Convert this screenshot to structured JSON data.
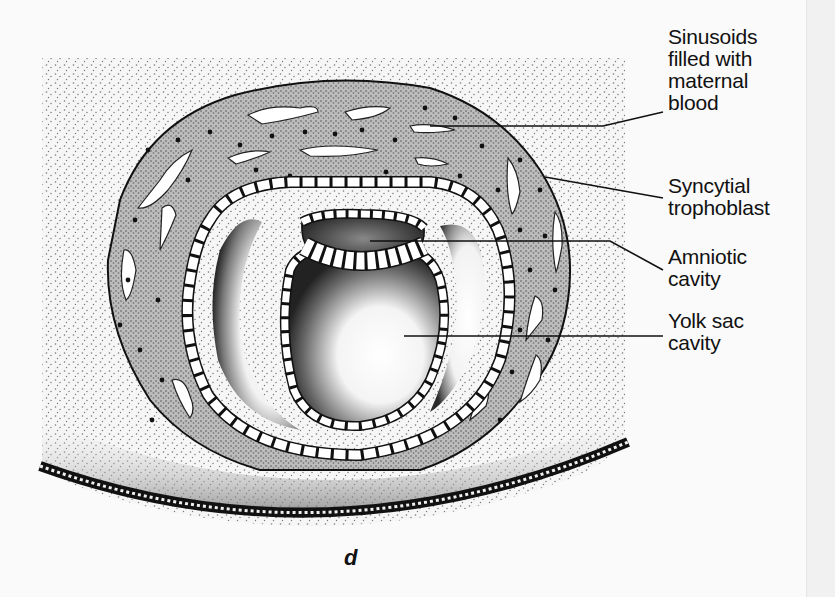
{
  "figure": {
    "caption": "d",
    "labels": [
      {
        "id": "sinusoids",
        "lines": [
          "Sinusoids",
          "filled with",
          "maternal",
          "blood"
        ]
      },
      {
        "id": "syncytial-trophoblast",
        "lines": [
          "Syncytial",
          "trophoblast"
        ]
      },
      {
        "id": "amniotic-cavity",
        "lines": [
          "Amniotic",
          "cavity"
        ]
      },
      {
        "id": "yolk-sac-cavity",
        "lines": [
          "Yolk sac",
          "cavity"
        ]
      }
    ],
    "colors": {
      "ink": "#111111",
      "paper": "#fafafa"
    }
  }
}
